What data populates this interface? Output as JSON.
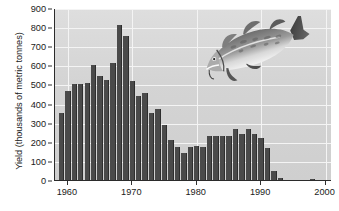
{
  "chart_data": {
    "type": "bar",
    "title": "",
    "subtitle": "",
    "xlabel": "",
    "ylabel": "Yield (thousands of metric tonnes)",
    "ylim": [
      0,
      900
    ],
    "xlim": [
      1958,
      2001
    ],
    "y_ticks": [
      0,
      100,
      200,
      300,
      400,
      500,
      600,
      700,
      800,
      900
    ],
    "x_ticks": [
      1960,
      1970,
      1980,
      1990,
      2000
    ],
    "grid": true,
    "legend": null,
    "units": "thousands of metric tonnes",
    "annotations": [
      "atlantic-cod-illustration"
    ],
    "categories": [
      1959,
      1960,
      1961,
      1962,
      1963,
      1964,
      1965,
      1966,
      1967,
      1968,
      1969,
      1970,
      1971,
      1972,
      1973,
      1974,
      1975,
      1976,
      1977,
      1978,
      1979,
      1980,
      1981,
      1982,
      1983,
      1984,
      1985,
      1986,
      1987,
      1988,
      1989,
      1990,
      1991,
      1992,
      1993,
      1994,
      1995,
      1996,
      1997,
      1998,
      1999
    ],
    "values": [
      350,
      465,
      505,
      505,
      508,
      600,
      545,
      523,
      610,
      810,
      752,
      520,
      438,
      457,
      352,
      372,
      288,
      212,
      172,
      140,
      172,
      178,
      172,
      232,
      232,
      228,
      232,
      268,
      240,
      268,
      240,
      220,
      170,
      45,
      12,
      0,
      0,
      0,
      0,
      5,
      0
    ]
  },
  "axis": {
    "y_tick_labels": [
      "900",
      "800",
      "700",
      "600",
      "500",
      "400",
      "300",
      "200",
      "100",
      "0"
    ],
    "x_tick_labels": [
      "1960",
      "1970",
      "1980",
      "1990",
      "2000"
    ]
  },
  "colors": {
    "bar": "#4a4a4a",
    "plot_background": "#d4d4d4",
    "gridline": "#f4f4f4",
    "axis_line": "#2b2b2b",
    "text": "#1a1a1a",
    "page_background": "#ffffff"
  },
  "illustration": {
    "name": "atlantic-cod",
    "body": "#8c8c8c",
    "belly": "#e8e8e8",
    "dark": "#2f2f2f",
    "mid": "#6a6a6a"
  }
}
